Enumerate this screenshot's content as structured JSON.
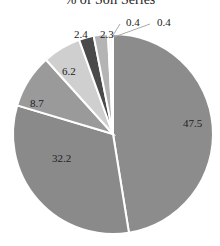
{
  "chart_data": {
    "type": "pie",
    "title": "% of Soil Series",
    "title_note": "title is clipped at the top of the screenshot; only the lower edge of the glyphs is visible, so the wording (particularly 'Soil') is inferred rather than read",
    "categories": [
      "A",
      "B",
      "C",
      "D",
      "E",
      "F",
      "G",
      "H"
    ],
    "values": [
      47.5,
      32.2,
      8.7,
      6.2,
      2.4,
      2.3,
      0.4,
      0.4
    ],
    "labels": [
      "47.5",
      "32.2",
      "8.7",
      "6.2",
      "2.4",
      "2.3",
      "0.4",
      "0.4"
    ],
    "colors": [
      "#8c8c8c",
      "#8a8a8a",
      "#9a9a9a",
      "#cfcfcf",
      "#4a4a4a",
      "#b4b4b4",
      "#dcdcdc",
      "#e8e8e8"
    ],
    "legend": "none",
    "start_angle_deg": 0,
    "direction": "clockwise"
  }
}
